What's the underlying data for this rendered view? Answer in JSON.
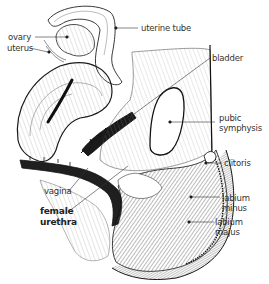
{
  "figure": {
    "colors": {
      "background": "#ffffff",
      "line": "#1a1a1a",
      "shade_dark": "#2b2b2b",
      "shade_mid": "#6e6e6e",
      "shade_light": "#bdbdbd",
      "label_text": "#333333",
      "leader_line": "#333333"
    }
  },
  "labels": {
    "ovary": "ovary",
    "uterine_tube": "uterine tube",
    "uterus": "uterus",
    "bladder": "bladder",
    "pubic_symphysis_1": "pubic",
    "pubic_symphysis_2": "symphysis",
    "clitoris": "clitoris",
    "vagina": "vagina",
    "female_urethra_1": "female",
    "female_urethra_2": "urethra",
    "labium_minus_1": "labium",
    "labium_minus_2": "minus",
    "labium_majus_1": "labium",
    "labium_majus_2": "majus"
  }
}
